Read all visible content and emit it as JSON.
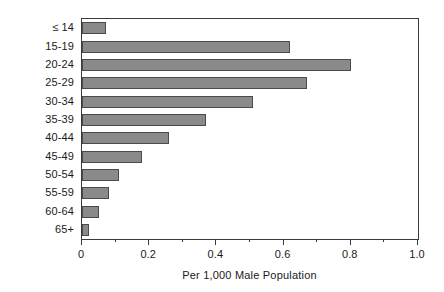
{
  "chart_data": {
    "type": "bar",
    "orientation": "horizontal",
    "title": "",
    "xlabel": "Per 1,000 Male Population",
    "ylabel": "Age",
    "xlim": [
      0,
      1.0
    ],
    "grid": false,
    "legend": null,
    "categories": [
      "≤ 14",
      "15-19",
      "20-24",
      "25-29",
      "30-34",
      "35-39",
      "40-44",
      "45-49",
      "50-54",
      "55-59",
      "60-64",
      "65+"
    ],
    "values": [
      0.07,
      0.62,
      0.8,
      0.67,
      0.51,
      0.37,
      0.26,
      0.18,
      0.11,
      0.08,
      0.05,
      0.02
    ],
    "xticks": [
      0,
      0.2,
      0.4,
      0.6,
      0.8,
      1.0
    ],
    "xtick_labels": [
      "0",
      "0.2",
      "0.4",
      "0.6",
      "0.8",
      "1.0"
    ],
    "xticks_minor": [
      0.1,
      0.3,
      0.5,
      0.7,
      0.9
    ],
    "bar_color": "#8a8a8a",
    "bar_edge_color": "#4a4a4a",
    "frame_color": "#3a3a3a",
    "background": "#ffffff"
  }
}
